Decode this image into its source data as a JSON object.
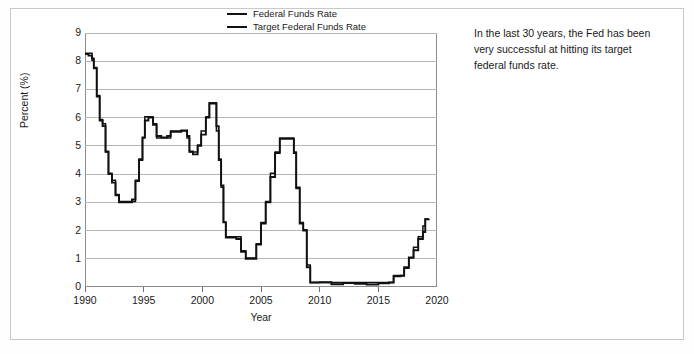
{
  "annotation": {
    "text": "In the last 30 years, the Fed has been very successful at hitting its target federal funds rate."
  },
  "legend": {
    "position": "top-center",
    "entries": [
      {
        "label": "Federal Funds Rate",
        "color": "#111111"
      },
      {
        "label": "Target Federal Funds Rate",
        "color": "#111111"
      }
    ]
  },
  "chart_data": {
    "type": "line",
    "title": "",
    "xlabel": "Year",
    "ylabel": "Percent (%)",
    "xlim": [
      1990,
      2020
    ],
    "ylim": [
      0,
      9
    ],
    "xticks": [
      1990,
      1995,
      2000,
      2005,
      2010,
      2015,
      2020
    ],
    "yticks": [
      0,
      1,
      2,
      3,
      4,
      5,
      6,
      7,
      8,
      9
    ],
    "grid": "horizontal",
    "line_color": "#111111",
    "grid_color": "#b6b6b6",
    "background": "#ffffff",
    "series": [
      {
        "name": "Federal Funds Rate",
        "color": "#111111",
        "x": [
          1990.0,
          1990.3,
          1990.6,
          1990.75,
          1991.0,
          1991.25,
          1991.5,
          1991.75,
          1992.0,
          1992.3,
          1992.6,
          1992.9,
          1993.2,
          1993.6,
          1994.0,
          1994.3,
          1994.6,
          1994.9,
          1995.1,
          1995.4,
          1995.8,
          1996.1,
          1996.5,
          1997.0,
          1997.3,
          1997.7,
          1998.2,
          1998.7,
          1998.9,
          1999.2,
          1999.6,
          1999.9,
          2000.3,
          2000.6,
          2001.0,
          2001.2,
          2001.4,
          2001.6,
          2001.8,
          2002.0,
          2002.4,
          2002.9,
          2003.3,
          2003.7,
          2004.2,
          2004.6,
          2005.0,
          2005.4,
          2005.8,
          2006.2,
          2006.6,
          2007.0,
          2007.5,
          2007.8,
          2008.0,
          2008.3,
          2008.6,
          2008.9,
          2009.2,
          2010.0,
          2011.0,
          2012.0,
          2013.0,
          2014.0,
          2015.0,
          2015.9,
          2016.3,
          2016.9,
          2017.2,
          2017.6,
          2018.0,
          2018.4,
          2018.8,
          2019.0,
          2019.3
        ],
        "y": [
          8.25,
          8.2,
          8.1,
          7.75,
          6.75,
          5.9,
          5.7,
          4.8,
          4.0,
          3.7,
          3.25,
          3.0,
          3.0,
          3.0,
          3.1,
          3.75,
          4.5,
          5.3,
          5.9,
          6.0,
          5.75,
          5.35,
          5.3,
          5.35,
          5.5,
          5.5,
          5.55,
          5.35,
          4.8,
          4.7,
          5.0,
          5.4,
          6.0,
          6.5,
          6.5,
          5.7,
          4.5,
          3.6,
          2.3,
          1.75,
          1.75,
          1.7,
          1.25,
          1.0,
          1.0,
          1.5,
          2.25,
          3.0,
          3.9,
          4.75,
          5.25,
          5.25,
          5.25,
          4.75,
          3.5,
          2.25,
          2.0,
          0.7,
          0.16,
          0.17,
          0.1,
          0.14,
          0.11,
          0.09,
          0.13,
          0.16,
          0.38,
          0.4,
          0.7,
          1.05,
          1.3,
          1.7,
          1.95,
          2.4,
          2.42
        ],
        "notes": "Effective federal funds rate, monthly average"
      },
      {
        "name": "Target Federal Funds Rate",
        "color": "#111111",
        "x": [
          1990.0,
          1990.3,
          1990.6,
          1990.75,
          1991.0,
          1991.25,
          1991.5,
          1991.75,
          1992.0,
          1992.3,
          1992.6,
          1992.9,
          1993.2,
          1993.6,
          1994.0,
          1994.3,
          1994.6,
          1994.9,
          1995.1,
          1995.4,
          1995.8,
          1996.1,
          1996.5,
          1997.0,
          1997.3,
          1997.7,
          1998.2,
          1998.7,
          1998.9,
          1999.2,
          1999.6,
          1999.9,
          2000.3,
          2000.6,
          2001.0,
          2001.2,
          2001.4,
          2001.6,
          2001.8,
          2002.0,
          2002.4,
          2002.9,
          2003.3,
          2003.7,
          2004.2,
          2004.6,
          2005.0,
          2005.4,
          2005.8,
          2006.2,
          2006.6,
          2007.0,
          2007.5,
          2007.8,
          2008.0,
          2008.3,
          2008.6,
          2008.9,
          2009.2,
          2010.0,
          2011.0,
          2012.0,
          2013.0,
          2014.0,
          2015.0,
          2015.9,
          2016.3,
          2016.9,
          2017.2,
          2017.6,
          2018.0,
          2018.4,
          2018.8,
          2019.0,
          2019.3
        ],
        "y": [
          8.25,
          8.25,
          8.0,
          7.75,
          6.75,
          5.9,
          5.75,
          4.75,
          4.0,
          3.75,
          3.25,
          3.0,
          3.0,
          3.0,
          3.0,
          3.75,
          4.5,
          5.25,
          6.0,
          6.0,
          5.75,
          5.25,
          5.25,
          5.25,
          5.5,
          5.5,
          5.5,
          5.25,
          4.75,
          4.75,
          5.0,
          5.5,
          6.0,
          6.5,
          6.5,
          5.5,
          4.5,
          3.5,
          2.25,
          1.75,
          1.75,
          1.75,
          1.25,
          1.0,
          1.0,
          1.5,
          2.25,
          3.0,
          4.0,
          4.75,
          5.25,
          5.25,
          5.25,
          4.75,
          3.5,
          2.25,
          2.0,
          0.75,
          0.13,
          0.13,
          0.13,
          0.13,
          0.13,
          0.13,
          0.13,
          0.13,
          0.38,
          0.38,
          0.63,
          1.0,
          1.38,
          1.75,
          2.13,
          2.38,
          2.38
        ],
        "notes": "FOMC target rate (midpoint after 2008)"
      }
    ]
  }
}
